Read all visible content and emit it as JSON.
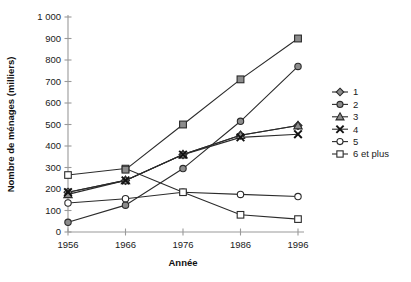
{
  "chart_data": {
    "type": "line",
    "title": "",
    "xlabel": "Année",
    "ylabel": "Nombre de ménages (milliers)",
    "x": [
      1956,
      1966,
      1976,
      1986,
      1996
    ],
    "categories": [
      "1956",
      "1966",
      "1976",
      "1986",
      "1996"
    ],
    "xtick_labels": [
      "1956",
      "1966",
      "1976",
      "1986",
      "1996"
    ],
    "ytick_labels": [
      "0",
      "100",
      "200",
      "300",
      "400",
      "500",
      "600",
      "700",
      "800",
      "900",
      "1 000"
    ],
    "ytick_values": [
      0,
      100,
      200,
      300,
      400,
      500,
      600,
      700,
      800,
      900,
      1000
    ],
    "ylim": [
      0,
      1000
    ],
    "xlim": [
      1956,
      1996
    ],
    "grid": false,
    "legend_position": "right",
    "series": [
      {
        "name": "1",
        "marker": "diamond-filled",
        "values": [
          185,
          240,
          360,
          450,
          495
        ]
      },
      {
        "name": "2",
        "marker": "circle-filled",
        "values": [
          45,
          125,
          295,
          515,
          770
        ]
      },
      {
        "name": "3",
        "marker": "triangle-filled",
        "values": [
          175,
          240,
          360,
          450,
          495
        ]
      },
      {
        "name": "4",
        "marker": "cross-x",
        "values": [
          185,
          240,
          360,
          440,
          455
        ]
      },
      {
        "name": "5",
        "marker": "circle-open",
        "values": [
          135,
          155,
          185,
          175,
          165
        ]
      },
      {
        "name": "6 et plus",
        "marker": "square-open",
        "values": [
          265,
          295,
          185,
          80,
          60
        ]
      }
    ],
    "extra_series": [
      {
        "name": "square-filled-overlay",
        "marker": "square-filled",
        "values": [
          null,
          290,
          500,
          710,
          900
        ]
      }
    ]
  },
  "legend": {
    "items": [
      {
        "label": "1",
        "icon": "diamond-marker-icon"
      },
      {
        "label": "2",
        "icon": "circle-marker-icon"
      },
      {
        "label": "3",
        "icon": "triangle-marker-icon"
      },
      {
        "label": "4",
        "icon": "cross-marker-icon"
      },
      {
        "label": "5",
        "icon": "circle-open-marker-icon"
      },
      {
        "label": "6 et plus",
        "icon": "square-open-marker-icon"
      }
    ]
  },
  "colors": {
    "line": "#2b2b2b",
    "axis": "#9a9a9a",
    "marker_fill_gray": "#8c8c8c",
    "marker_fill_white": "#ffffff",
    "marker_stroke": "#2b2b2b",
    "text": "#1a1a1a",
    "background": "#ffffff"
  }
}
